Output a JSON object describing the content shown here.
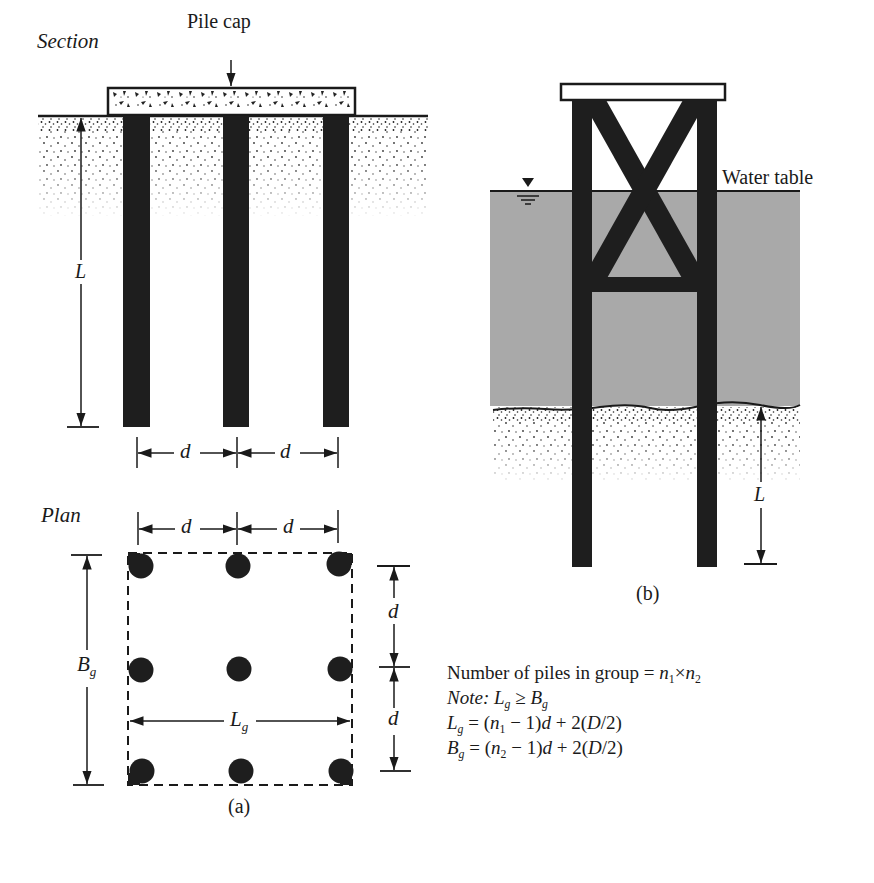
{
  "figure": {
    "panel_a": {
      "section_label": "Section",
      "plan_label": "Plan",
      "pile_cap_label": "Pile cap",
      "length_label": "L",
      "spacing_label": "d",
      "group_width_label": "B",
      "group_width_sub": "g",
      "group_length_label": "L",
      "group_length_sub": "g",
      "caption": "(a)",
      "piles_in_section": 3,
      "plan_grid": {
        "rows": 3,
        "cols": 3
      }
    },
    "panel_b": {
      "water_table_label": "Water table",
      "embedment_label": "L",
      "caption": "(b)",
      "colors": {
        "water": "#a9a9a9",
        "pile": "#1e1e1e"
      }
    },
    "notes": {
      "line1_text": "Number of piles in group = ",
      "line1_n1": "n",
      "line1_n1_sub": "1",
      "line1_times": "×",
      "line1_n2": "n",
      "line1_n2_sub": "2",
      "line2_prefix": "Note: ",
      "line2_lhs": "L",
      "line2_lhs_sub": "g",
      "line2_op": " ≥ ",
      "line2_rhs": "B",
      "line2_rhs_sub": "g",
      "line3_lhs": "L",
      "line3_lhs_sub": "g",
      "line3_eq": " = (",
      "line3_n": "n",
      "line3_n_sub": "1",
      "line3_rest_a": " − 1)",
      "line3_d": "d",
      "line3_rest_b": " + 2(",
      "line3_D": "D",
      "line3_rest_c": "/2)",
      "line4_lhs": "B",
      "line4_lhs_sub": "g",
      "line4_eq": " = (",
      "line4_n": "n",
      "line4_n_sub": "2",
      "line4_rest_a": " − 1)",
      "line4_d": "d",
      "line4_rest_b": " + 2(",
      "line4_D": "D",
      "line4_rest_c": "/2)"
    }
  }
}
